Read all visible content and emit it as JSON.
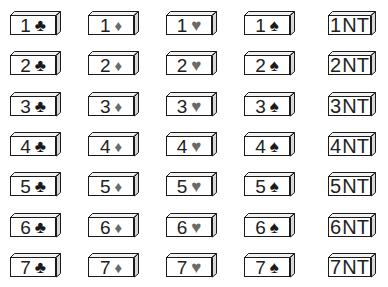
{
  "layout": {
    "column_x": [
      10,
      88,
      166,
      244,
      328
    ],
    "row_y": [
      11,
      51,
      92,
      132,
      172,
      213,
      253
    ]
  },
  "strains": [
    {
      "key": "clubs",
      "symbol": "♣",
      "color": "#1a1a1a",
      "tone": "black"
    },
    {
      "key": "diamonds",
      "symbol": "♦",
      "color": "#6a6a6a",
      "tone": "gray"
    },
    {
      "key": "hearts",
      "symbol": "♥",
      "color": "#6a6a6a",
      "tone": "gray"
    },
    {
      "key": "spades",
      "symbol": "♠",
      "color": "#1a1a1a",
      "tone": "black"
    },
    {
      "key": "notrump",
      "symbol": "NT",
      "color": "#222222",
      "tone": "text"
    }
  ],
  "bids": [
    {
      "level": "1",
      "cards": [
        "1♣",
        "1♦",
        "1♥",
        "1♠",
        "1NT"
      ]
    },
    {
      "level": "2",
      "cards": [
        "2♣",
        "2♦",
        "2♥",
        "2♠",
        "2NT"
      ]
    },
    {
      "level": "3",
      "cards": [
        "3♣",
        "3♦",
        "3♥",
        "3♠",
        "3NT"
      ]
    },
    {
      "level": "4",
      "cards": [
        "4♣",
        "4♦",
        "4♥",
        "4♠",
        "4NT"
      ]
    },
    {
      "level": "5",
      "cards": [
        "5♣",
        "5♦",
        "5♥",
        "5♠",
        "5NT"
      ]
    },
    {
      "level": "6",
      "cards": [
        "6♣",
        "6♦",
        "6♥",
        "6♠",
        "6NT"
      ]
    },
    {
      "level": "7",
      "cards": [
        "7♣",
        "7♦",
        "7♥",
        "7♠",
        "7NT"
      ]
    }
  ]
}
